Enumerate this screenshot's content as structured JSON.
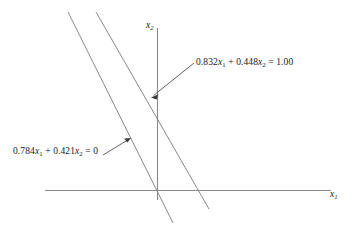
{
  "figure": {
    "background_color": "#ffffff",
    "axis_color": "#8a8a8a",
    "line_color": "#7a7a7a",
    "leader_color": "#3a3a3a",
    "text_color": "#1a1a1a"
  },
  "axes": {
    "horizontal": {
      "name": "x1-axis",
      "label_prefix": "x",
      "label_sub": "1"
    },
    "vertical": {
      "name": "x2-axis",
      "label_prefix": "x",
      "label_sub": "2"
    }
  },
  "lines": [
    {
      "id": "line-nonhomogeneous",
      "label_parts": {
        "coef1": "0.832",
        "var1": "x",
        "var1_sub": "1",
        "plus": " + ",
        "coef2": "0.448",
        "var2": "x",
        "var2_sub": "2",
        "equals": " = ",
        "rhs": "1.00"
      },
      "label_text": "0.832x1 + 0.448x2 = 1.00"
    },
    {
      "id": "line-homogeneous",
      "label_parts": {
        "coef1": "0.784",
        "var1": "x",
        "var1_sub": "1",
        "plus": " + ",
        "coef2": "0.421",
        "var2": "x",
        "var2_sub": "2",
        "equals": " = ",
        "rhs": "0"
      },
      "label_text": "0.784x1 + 0.421x2 = 0"
    }
  ]
}
